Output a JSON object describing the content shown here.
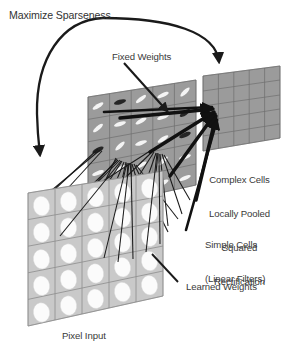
{
  "figure": {
    "background_color": "#ffffff",
    "width": 295,
    "height": 358
  },
  "labels": {
    "maximize_sparseness": "Maximize Sparseness",
    "fixed_weights": "Fixed Weights",
    "complex_cells_line1": "Complex Cells",
    "complex_cells_line2": "Locally Pooled",
    "complex_cells_line3": "Squared",
    "complex_cells_line4": "Rectification",
    "simple_cells_line1": "Simple Cells",
    "simple_cells_line2": "(Linear Filters)",
    "learned_weights": "Learned Weights",
    "pixel_input": "Pixel Input"
  },
  "colors": {
    "text": "#3a3a3a",
    "stroke": "#1a1a1a",
    "plane_light": "#c9c9c9",
    "plane_mid": "#9b9b9b",
    "plane_dark": "#8f8f8f",
    "cell_line": "#6e6e6e",
    "blob_white": "#f2f2f2",
    "blob_dark": "#2a2a2a",
    "page": "#ffffff"
  },
  "layers": [
    {
      "name": "pixel-input-plane",
      "label": "Pixel Input",
      "grid_rows": 5,
      "grid_cols": 5,
      "cell_content": "white-ellipse",
      "fill": "#c9c9c9"
    },
    {
      "name": "simple-cells-plane",
      "label": "Simple Cells (Linear Filters)",
      "grid_rows": 5,
      "grid_cols": 5,
      "cell_content": "oriented-gabor-bar",
      "fill": "#9b9b9b"
    },
    {
      "name": "complex-cells-plane",
      "label": "Complex Cells Locally Pooled Squared Rectification",
      "grid_rows": 5,
      "grid_cols": 5,
      "cell_content": "plain",
      "fill": "#9b9b9b"
    }
  ],
  "connections": [
    {
      "name": "learned-weights-fan",
      "from": "pixel-input-plane",
      "to": "simple-cells-plane",
      "style": "thin-black-lines"
    },
    {
      "name": "fixed-weights-fan",
      "from": "simple-cells-plane",
      "to": "complex-cells-plane",
      "style": "thick-black-arrows"
    },
    {
      "name": "sparseness-feedback-arc",
      "from": "complex-cells-plane",
      "to": "pixel-input-plane",
      "style": "curved-arrow"
    }
  ]
}
